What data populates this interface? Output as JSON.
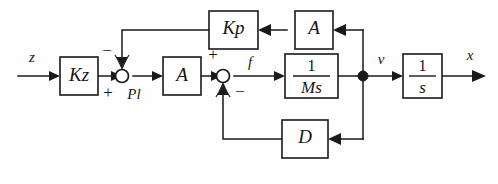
{
  "diagram": {
    "type": "control-block-diagram",
    "colors": {
      "line": "#1a1a1a",
      "background": "#fefefe",
      "block_fill": "#ffffff",
      "text": "#151515"
    },
    "blocks": [
      {
        "id": "kz",
        "label": "Kz",
        "name": "block-kz"
      },
      {
        "id": "a1",
        "label": "A",
        "name": "block-a-forward"
      },
      {
        "id": "ms",
        "label_num": "1",
        "label_den": "Ms",
        "name": "block-one-over-ms"
      },
      {
        "id": "s",
        "label_num": "1",
        "label_den": "s",
        "name": "block-one-over-s"
      },
      {
        "id": "kp",
        "label": "Kp",
        "name": "block-kp"
      },
      {
        "id": "a2",
        "label": "A",
        "name": "block-a-feedback"
      },
      {
        "id": "d",
        "label": "D",
        "name": "block-d"
      }
    ],
    "signals": {
      "input": "z",
      "force": "f",
      "velocity": "v",
      "output": "x"
    },
    "junctions": [
      {
        "id": "sum1",
        "name": "summing-junction-pl",
        "label": "Pl",
        "sign_top": "−",
        "sign_bottom": "+"
      },
      {
        "id": "sum2",
        "name": "summing-junction-force",
        "label": "",
        "sign_top": "+",
        "sign_bottom": "−"
      }
    ],
    "node_points": [
      {
        "id": "v-node",
        "name": "signal-tap-node-v"
      }
    ]
  }
}
